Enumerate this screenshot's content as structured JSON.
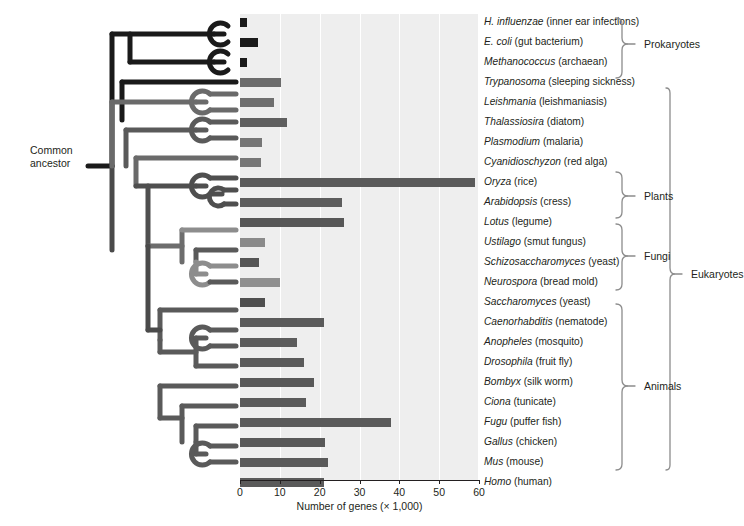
{
  "figure": {
    "axis_title": "Number of genes (× 1,000)",
    "common_ancestor_label": "Common\nancestor",
    "common_ancestor_line1": "Common",
    "common_ancestor_line2": "ancestor"
  },
  "groups": [
    {
      "name": "prokaryotes-bracket",
      "label": "Prokaryotes"
    },
    {
      "name": "plants-bracket",
      "label": "Plants"
    },
    {
      "name": "fungi-bracket",
      "label": "Fungi"
    },
    {
      "name": "animals-bracket",
      "label": "Animals"
    },
    {
      "name": "eukaryotes-bracket",
      "label": "Eukaryotes"
    }
  ],
  "chart_data": {
    "type": "bar",
    "orientation": "horizontal",
    "title": "",
    "xlabel": "Number of genes (× 1,000)",
    "ylabel": "",
    "xlim": [
      0,
      60
    ],
    "xticks": [
      0,
      10,
      20,
      30,
      40,
      50,
      60
    ],
    "grid": true,
    "grid_axis": "x",
    "legend": "none",
    "units": "thousands of genes",
    "categories": [
      "H. influenzae (inner ear infections)",
      "E. coli (gut bacterium)",
      "Methanococcus (archaean)",
      "Trypanosoma (sleeping sickness)",
      "Leishmania (leishmaniasis)",
      "Thalassiosira (diatom)",
      "Plasmodium (malaria)",
      "Cyanidioschyzon (red alga)",
      "Oryza (rice)",
      "Arabidopsis (cress)",
      "Lotus (legume)",
      "Ustilago (smut fungus)",
      "Schizosaccharomyces (yeast)",
      "Neurospora (bread mold)",
      "Saccharomyces (yeast)",
      "Caenorhabditis (nematode)",
      "Anopheles (mosquito)",
      "Drosophila (fruit fly)",
      "Bombyx (silk worm)",
      "Ciona (tunicate)",
      "Fugu (puffer fish)",
      "Gallus (chicken)",
      "Mus (mouse)",
      "Homo (human)"
    ],
    "values": [
      1.7,
      4.4,
      1.8,
      10.3,
      8.5,
      11.7,
      5.5,
      5.3,
      59.0,
      25.5,
      26.2,
      6.4,
      4.8,
      10.1,
      6.4,
      21.0,
      14.3,
      16.0,
      18.5,
      16.5,
      38.0,
      21.4,
      22.0,
      21.0
    ],
    "bar_colors": [
      "#1a1a1a",
      "#1a1a1a",
      "#1a1a1a",
      "#6b6b6b",
      "#6e6e6e",
      "#5f5f5f",
      "#767676",
      "#777777",
      "#5a5a5a",
      "#5d5d5d",
      "#575757",
      "#8a8a8a",
      "#555555",
      "#8f8f8f",
      "#4f4f4f",
      "#5a5a5a",
      "#5c5c5c",
      "#5a5a5a",
      "#585858",
      "#5a5a5a",
      "#5a5a5a",
      "#585858",
      "#5a5a5a",
      "#5a5a5a"
    ]
  },
  "taxa": [
    {
      "genus": "H. influenzae",
      "common": "(inner ear infections)"
    },
    {
      "genus": "E. coli",
      "common": "(gut bacterium)"
    },
    {
      "genus": "Methanococcus",
      "common": "(archaean)"
    },
    {
      "genus": "Trypanosoma",
      "common": "(sleeping sickness)"
    },
    {
      "genus": "Leishmania",
      "common": "(leishmaniasis)"
    },
    {
      "genus": "Thalassiosira",
      "common": "(diatom)"
    },
    {
      "genus": "Plasmodium",
      "common": "(malaria)"
    },
    {
      "genus": "Cyanidioschyzon",
      "common": "(red alga)"
    },
    {
      "genus": "Oryza",
      "common": "(rice)"
    },
    {
      "genus": "Arabidopsis",
      "common": "(cress)"
    },
    {
      "genus": "Lotus",
      "common": "(legume)"
    },
    {
      "genus": "Ustilago",
      "common": "(smut fungus)"
    },
    {
      "genus": "Schizosaccharomyces",
      "common": "(yeast)"
    },
    {
      "genus": "Neurospora",
      "common": "(bread mold)"
    },
    {
      "genus": "Saccharomyces",
      "common": "(yeast)"
    },
    {
      "genus": "Caenorhabditis",
      "common": "(nematode)"
    },
    {
      "genus": "Anopheles",
      "common": "(mosquito)"
    },
    {
      "genus": "Drosophila",
      "common": "(fruit fly)"
    },
    {
      "genus": "Bombyx",
      "common": "(silk worm)"
    },
    {
      "genus": "Ciona",
      "common": "(tunicate)"
    },
    {
      "genus": "Fugu",
      "common": "(puffer fish)"
    },
    {
      "genus": "Gallus",
      "common": "(chicken)"
    },
    {
      "genus": "Mus",
      "common": "(mouse)"
    },
    {
      "genus": "Homo",
      "common": "(human)"
    }
  ],
  "colors": {
    "panel_bg": "#eeeeee",
    "gridline": "#ffffff",
    "axis": "#231f20",
    "text": "#231f20",
    "tree_dark": "#1a1a1a",
    "tree_mid": "#4a4a4a",
    "tree_light": "#8d8d8d",
    "bracket": "#8c8c8c"
  }
}
